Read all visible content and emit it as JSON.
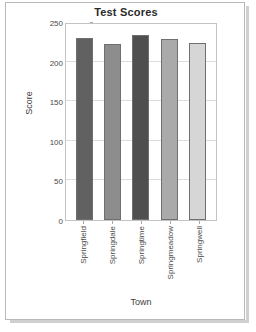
{
  "frame": {
    "border_color": "#b9b9b9",
    "background": "#ffffff"
  },
  "chart_data": {
    "type": "bar",
    "title": "Test Scores",
    "xlabel": "Town",
    "ylabel": "Score",
    "categories": [
      "Springfield",
      "Springdale",
      "Springtime",
      "Springmeadow",
      "Springwell"
    ],
    "values": [
      230,
      222,
      234,
      228,
      224
    ],
    "ylim": [
      0,
      250
    ],
    "yticks": [
      0,
      50,
      100,
      150,
      200,
      250
    ],
    "ytick_labels": [
      "0",
      "50",
      "100",
      "150",
      "200",
      "250"
    ],
    "grid": true,
    "grid_axis": "y",
    "legend": false,
    "bar_colors": [
      "#616161",
      "#8d8d8d",
      "#4f4f4f",
      "#aaaaaa",
      "#d6d6d6"
    ],
    "bar_edge_color": "#6f6f6f",
    "series": [
      {
        "name": "Test Scores",
        "values": [
          230,
          222,
          234,
          228,
          224
        ]
      }
    ]
  }
}
